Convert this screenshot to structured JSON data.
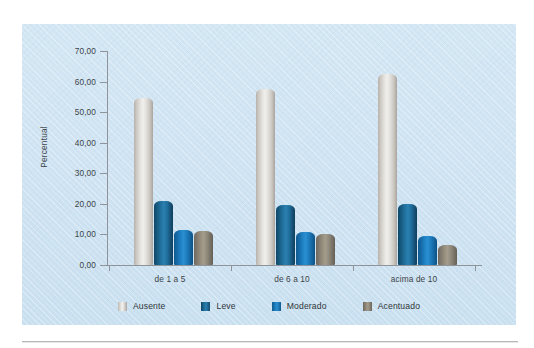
{
  "page": {
    "top_clipped_text": "",
    "bottom_rule": "horizontal-rule"
  },
  "chart_data": {
    "type": "bar",
    "title": "",
    "xlabel": "",
    "ylabel": "Percentual",
    "ylim": [
      0,
      70
    ],
    "ytick_step": 10,
    "grid": false,
    "legend_position": "bottom",
    "decimal_separator": ",",
    "categories": [
      "de 1 a 5",
      "de 6 a 10",
      "acima de 10"
    ],
    "ytick_labels": [
      "0,00",
      "10,00",
      "20,00",
      "30,00",
      "40,00",
      "50,00",
      "60,00",
      "70,00"
    ],
    "ytick_values": [
      0,
      10,
      20,
      30,
      40,
      50,
      60,
      70
    ],
    "series": [
      {
        "name": "Ausente",
        "color": "#e6e4e0",
        "values": [
          54.7,
          57.5,
          62.5
        ]
      },
      {
        "name": "Leve",
        "color": "#1f6e9c",
        "values": [
          21.1,
          19.7,
          19.8
        ]
      },
      {
        "name": "Moderado",
        "color": "#1d7bbc",
        "values": [
          11.3,
          10.9,
          9.6
        ]
      },
      {
        "name": "Acentuado",
        "color": "#908a7c",
        "values": [
          11.2,
          10.2,
          6.7
        ]
      }
    ]
  },
  "legend": {
    "items": [
      {
        "label": "Ausente",
        "swatch": "ausente"
      },
      {
        "label": "Leve",
        "swatch": "leve"
      },
      {
        "label": "Moderado",
        "swatch": "moderado"
      },
      {
        "label": "Acentuado",
        "swatch": "acentuado"
      }
    ]
  },
  "colors": {
    "panel_background": "#cfe3f2",
    "axis": "#8e9499",
    "text": "#3d4448",
    "page_background": "#ffffff",
    "rule": "#b9b9b9"
  }
}
